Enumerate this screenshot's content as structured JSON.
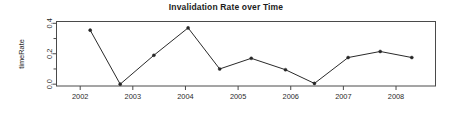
{
  "chart_data": {
    "type": "line",
    "title": "Invalidation Rate over Time",
    "xlabel": "",
    "ylabel": "timeRate",
    "xlim": [
      2001.55,
      2008.75
    ],
    "ylim": [
      -0.012,
      0.412
    ],
    "grid": false,
    "legend": null,
    "x_tick_labels": [
      "2002",
      "2003",
      "2004",
      "2005",
      "2006",
      "2007",
      "2008"
    ],
    "x_tick_values": [
      2002,
      2003,
      2004,
      2005,
      2006,
      2007,
      2008
    ],
    "y_tick_labels": [
      "0.0",
      "0.2",
      "0.4"
    ],
    "y_tick_values": [
      0.0,
      0.2,
      0.4
    ],
    "y_minor_tick_values": [
      0.1,
      0.3
    ],
    "marker": "filled-circle",
    "line_color": "#2a2a2a",
    "marker_color": "#262626",
    "series": [
      {
        "name": "timeRate",
        "x": [
          2002.19,
          2002.76,
          2003.4,
          2004.05,
          2004.65,
          2005.25,
          2005.9,
          2006.45,
          2007.09,
          2007.7,
          2008.3
        ],
        "values": [
          0.355,
          0.0,
          0.19,
          0.37,
          0.1,
          0.17,
          0.095,
          0.005,
          0.175,
          0.215,
          0.175
        ]
      }
    ]
  }
}
